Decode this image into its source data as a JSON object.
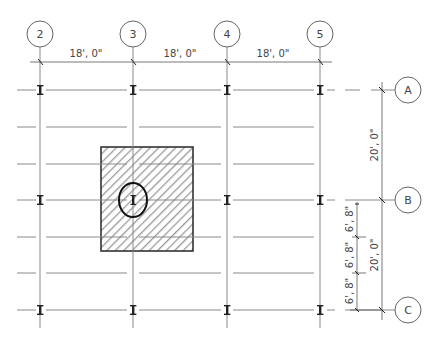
{
  "drawing": {
    "type": "structural grid plan",
    "column_grid": [
      {
        "label": "2",
        "x": 40
      },
      {
        "label": "3",
        "x": 133
      },
      {
        "label": "4",
        "x": 227
      },
      {
        "label": "5",
        "x": 320
      }
    ],
    "row_grid": [
      {
        "label": "A",
        "y": 90
      },
      {
        "label": "B",
        "y": 200
      },
      {
        "label": "C",
        "y": 310
      }
    ],
    "joist_lines_y": [
      127,
      164,
      237,
      273
    ],
    "horizontal_dimensions": [
      {
        "from": "2",
        "to": "3",
        "text": "18', 0\""
      },
      {
        "from": "3",
        "to": "4",
        "text": "18', 0\""
      },
      {
        "from": "4",
        "to": "5",
        "text": "18', 0\""
      }
    ],
    "vertical_dimensions": [
      {
        "from": "A",
        "to": "B",
        "text": "20', 0\""
      },
      {
        "from": "B",
        "to": "C",
        "text": "20', 0\""
      }
    ],
    "subdivision_dimensions": [
      {
        "text": "6', 8\""
      },
      {
        "text": "6', 8\""
      },
      {
        "text": "6', 8\""
      }
    ],
    "tributary_area": {
      "hatched": true,
      "highlighted_column": {
        "grid": "3-B",
        "marker": "ellipse"
      }
    },
    "colors": {
      "line": "#8a8a8a",
      "ink": "#222222",
      "hatch": "#999999"
    }
  }
}
